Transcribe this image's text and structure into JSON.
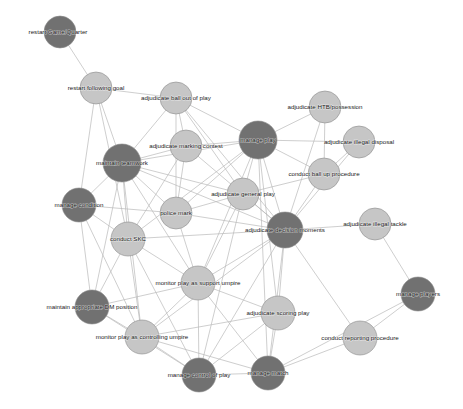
{
  "graph": {
    "title": "Umpire competency network",
    "background_color": "#ffffff",
    "edge_color": "#b9b9b9",
    "node_colors": {
      "dark": "#717171",
      "light": "#c6c6c6",
      "mid": "#a8a8a8",
      "stroke": "#8c8c8c"
    },
    "width": 463,
    "height": 409
  },
  "chart_data": {
    "type": "network",
    "xlabel": "",
    "ylabel": "",
    "legend": [],
    "grid": false,
    "nodes": [
      {
        "id": "restart_game_quarter",
        "label": "restart Game/Quarter",
        "x": 60,
        "y": 32,
        "r": 16,
        "shade": "dark",
        "label_dx": -2,
        "label_dy": 0
      },
      {
        "id": "restart_following_goal",
        "label": "restart following goal",
        "x": 96,
        "y": 88,
        "r": 16,
        "shade": "light",
        "label_dx": 0,
        "label_dy": 0
      },
      {
        "id": "adjudicate_ball_out_of_play",
        "label": "adjudicate ball out of play",
        "x": 176,
        "y": 98,
        "r": 16,
        "shade": "light",
        "label_dx": 0,
        "label_dy": 0
      },
      {
        "id": "adjudicate_htb_possession",
        "label": "adjudicate HTB/possession",
        "x": 325,
        "y": 107,
        "r": 16,
        "shade": "light",
        "label_dx": 0,
        "label_dy": 0
      },
      {
        "id": "adjudicate_marking_contest",
        "label": "adjudicate marking contest",
        "x": 186,
        "y": 146,
        "r": 16,
        "shade": "light",
        "label_dx": 0,
        "label_dy": 0
      },
      {
        "id": "manage_play",
        "label": "manage play",
        "x": 258,
        "y": 140,
        "r": 19,
        "shade": "dark",
        "label_dx": 0,
        "label_dy": 0
      },
      {
        "id": "adjudicate_illegal_disposal",
        "label": "adjudicate illegal disposal",
        "x": 359,
        "y": 142,
        "r": 16,
        "shade": "light",
        "label_dx": 0,
        "label_dy": 0
      },
      {
        "id": "maintain_teamwork",
        "label": "maintain teamwork",
        "x": 122,
        "y": 163,
        "r": 19,
        "shade": "dark",
        "label_dx": 0,
        "label_dy": 0
      },
      {
        "id": "conduct_ball_up_procedure",
        "label": "conduct ball up procedure",
        "x": 324,
        "y": 174,
        "r": 16,
        "shade": "light",
        "label_dx": 0,
        "label_dy": 0
      },
      {
        "id": "adjudicate_general_play",
        "label": "adjudicate general play",
        "x": 243,
        "y": 194,
        "r": 16,
        "shade": "light",
        "label_dx": 0,
        "label_dy": 0
      },
      {
        "id": "manage_condition",
        "label": "manage condition",
        "x": 79,
        "y": 205,
        "r": 17,
        "shade": "dark",
        "label_dx": 0,
        "label_dy": 0
      },
      {
        "id": "police_mark",
        "label": "police mark",
        "x": 176,
        "y": 213,
        "r": 16,
        "shade": "light",
        "label_dx": 0,
        "label_dy": 0
      },
      {
        "id": "adjudicate_decision_moments",
        "label": "adjudicate decision moments",
        "x": 285,
        "y": 230,
        "r": 18,
        "shade": "dark",
        "label_dx": 0,
        "label_dy": 0
      },
      {
        "id": "adjudicate_illegal_tackle",
        "label": "adjudicate illegal tackle",
        "x": 375,
        "y": 224,
        "r": 16,
        "shade": "light",
        "label_dx": 0,
        "label_dy": 0
      },
      {
        "id": "conduct_skc",
        "label": "conduct SKC",
        "x": 128,
        "y": 239,
        "r": 17,
        "shade": "light",
        "label_dx": 0,
        "label_dy": 0
      },
      {
        "id": "monitor_play_as_support_umpire",
        "label": "monitor play as support umpire",
        "x": 198,
        "y": 283,
        "r": 17,
        "shade": "light",
        "label_dx": 0,
        "label_dy": 0
      },
      {
        "id": "manage_players",
        "label": "manage players",
        "x": 418,
        "y": 294,
        "r": 17,
        "shade": "dark",
        "label_dx": 0,
        "label_dy": 0
      },
      {
        "id": "maintain_appropriate_dm_position",
        "label": "maintain appropriate DM position",
        "x": 92,
        "y": 307,
        "r": 17,
        "shade": "dark",
        "label_dx": 0,
        "label_dy": 0
      },
      {
        "id": "adjudicate_scoring_play",
        "label": "adjudicate scoring play",
        "x": 278,
        "y": 313,
        "r": 17,
        "shade": "light",
        "label_dx": 0,
        "label_dy": 0
      },
      {
        "id": "monitor_play_as_controlling_umpire",
        "label": "monitor play as controlling umpire",
        "x": 142,
        "y": 337,
        "r": 17,
        "shade": "light",
        "label_dx": 0,
        "label_dy": 0
      },
      {
        "id": "conduct_reporting_procedure",
        "label": "conduct reporting procedure",
        "x": 360,
        "y": 338,
        "r": 17,
        "shade": "light",
        "label_dx": 0,
        "label_dy": 0
      },
      {
        "id": "manage_control_of_play",
        "label": "manage control of play",
        "x": 199,
        "y": 375,
        "r": 17,
        "shade": "dark",
        "label_dx": 0,
        "label_dy": 0
      },
      {
        "id": "manage_match",
        "label": "manage match",
        "x": 268,
        "y": 373,
        "r": 17,
        "shade": "dark",
        "label_dx": 0,
        "label_dy": 0
      }
    ],
    "edges": [
      [
        "restart_game_quarter",
        "restart_following_goal"
      ],
      [
        "restart_following_goal",
        "adjudicate_ball_out_of_play"
      ],
      [
        "restart_following_goal",
        "maintain_teamwork"
      ],
      [
        "restart_following_goal",
        "manage_condition"
      ],
      [
        "restart_following_goal",
        "conduct_skc"
      ],
      [
        "adjudicate_ball_out_of_play",
        "maintain_teamwork"
      ],
      [
        "adjudicate_ball_out_of_play",
        "manage_play"
      ],
      [
        "adjudicate_ball_out_of_play",
        "adjudicate_marking_contest"
      ],
      [
        "adjudicate_ball_out_of_play",
        "adjudicate_decision_moments"
      ],
      [
        "adjudicate_ball_out_of_play",
        "adjudicate_general_play"
      ],
      [
        "adjudicate_ball_out_of_play",
        "police_mark"
      ],
      [
        "adjudicate_htb_possession",
        "manage_play"
      ],
      [
        "adjudicate_htb_possession",
        "conduct_ball_up_procedure"
      ],
      [
        "adjudicate_htb_possession",
        "adjudicate_decision_moments"
      ],
      [
        "adjudicate_marking_contest",
        "maintain_teamwork"
      ],
      [
        "adjudicate_marking_contest",
        "manage_play"
      ],
      [
        "adjudicate_marking_contest",
        "adjudicate_decision_moments"
      ],
      [
        "adjudicate_marking_contest",
        "police_mark"
      ],
      [
        "adjudicate_marking_contest",
        "conduct_skc"
      ],
      [
        "manage_play",
        "adjudicate_illegal_disposal"
      ],
      [
        "manage_play",
        "conduct_ball_up_procedure"
      ],
      [
        "manage_play",
        "adjudicate_general_play"
      ],
      [
        "manage_play",
        "adjudicate_decision_moments"
      ],
      [
        "manage_play",
        "police_mark"
      ],
      [
        "manage_play",
        "maintain_teamwork"
      ],
      [
        "manage_play",
        "monitor_play_as_support_umpire"
      ],
      [
        "manage_play",
        "adjudicate_scoring_play"
      ],
      [
        "manage_play",
        "manage_match"
      ],
      [
        "manage_play",
        "conduct_skc"
      ],
      [
        "adjudicate_illegal_disposal",
        "conduct_ball_up_procedure"
      ],
      [
        "adjudicate_illegal_disposal",
        "adjudicate_decision_moments"
      ],
      [
        "maintain_teamwork",
        "manage_condition"
      ],
      [
        "maintain_teamwork",
        "conduct_skc"
      ],
      [
        "maintain_teamwork",
        "police_mark"
      ],
      [
        "maintain_teamwork",
        "adjudicate_general_play"
      ],
      [
        "maintain_teamwork",
        "monitor_play_as_support_umpire"
      ],
      [
        "maintain_teamwork",
        "adjudicate_decision_moments"
      ],
      [
        "maintain_teamwork",
        "maintain_appropriate_dm_position"
      ],
      [
        "maintain_teamwork",
        "monitor_play_as_controlling_umpire"
      ],
      [
        "conduct_ball_up_procedure",
        "adjudicate_decision_moments"
      ],
      [
        "conduct_ball_up_procedure",
        "adjudicate_general_play"
      ],
      [
        "adjudicate_general_play",
        "adjudicate_decision_moments"
      ],
      [
        "adjudicate_general_play",
        "police_mark"
      ],
      [
        "adjudicate_general_play",
        "monitor_play_as_support_umpire"
      ],
      [
        "adjudicate_general_play",
        "manage_control_of_play"
      ],
      [
        "manage_condition",
        "conduct_skc"
      ],
      [
        "manage_condition",
        "maintain_appropriate_dm_position"
      ],
      [
        "manage_condition",
        "monitor_play_as_controlling_umpire"
      ],
      [
        "manage_condition",
        "police_mark"
      ],
      [
        "police_mark",
        "adjudicate_decision_moments"
      ],
      [
        "police_mark",
        "monitor_play_as_support_umpire"
      ],
      [
        "adjudicate_decision_moments",
        "adjudicate_illegal_tackle"
      ],
      [
        "adjudicate_decision_moments",
        "adjudicate_scoring_play"
      ],
      [
        "adjudicate_decision_moments",
        "monitor_play_as_support_umpire"
      ],
      [
        "adjudicate_decision_moments",
        "monitor_play_as_controlling_umpire"
      ],
      [
        "adjudicate_decision_moments",
        "conduct_reporting_procedure"
      ],
      [
        "adjudicate_decision_moments",
        "manage_control_of_play"
      ],
      [
        "adjudicate_decision_moments",
        "manage_match"
      ],
      [
        "adjudicate_decision_moments",
        "conduct_skc"
      ],
      [
        "adjudicate_illegal_tackle",
        "manage_players"
      ],
      [
        "conduct_skc",
        "monitor_play_as_support_umpire"
      ],
      [
        "conduct_skc",
        "maintain_appropriate_dm_position"
      ],
      [
        "conduct_skc",
        "monitor_play_as_controlling_umpire"
      ],
      [
        "conduct_skc",
        "manage_control_of_play"
      ],
      [
        "monitor_play_as_support_umpire",
        "maintain_appropriate_dm_position"
      ],
      [
        "monitor_play_as_support_umpire",
        "monitor_play_as_controlling_umpire"
      ],
      [
        "monitor_play_as_support_umpire",
        "adjudicate_scoring_play"
      ],
      [
        "monitor_play_as_support_umpire",
        "manage_control_of_play"
      ],
      [
        "monitor_play_as_support_umpire",
        "manage_match"
      ],
      [
        "manage_players",
        "conduct_reporting_procedure"
      ],
      [
        "manage_players",
        "manage_match"
      ],
      [
        "maintain_appropriate_dm_position",
        "monitor_play_as_controlling_umpire"
      ],
      [
        "maintain_appropriate_dm_position",
        "manage_control_of_play"
      ],
      [
        "adjudicate_scoring_play",
        "manage_control_of_play"
      ],
      [
        "adjudicate_scoring_play",
        "manage_match"
      ],
      [
        "adjudicate_scoring_play",
        "monitor_play_as_controlling_umpire"
      ],
      [
        "monitor_play_as_controlling_umpire",
        "manage_control_of_play"
      ],
      [
        "monitor_play_as_controlling_umpire",
        "manage_match"
      ],
      [
        "conduct_reporting_procedure",
        "manage_match"
      ],
      [
        "manage_control_of_play",
        "manage_match"
      ]
    ]
  }
}
